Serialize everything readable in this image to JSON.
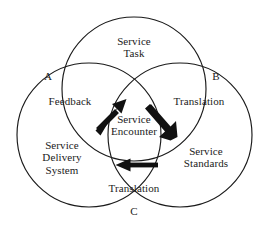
{
  "diagram": {
    "type": "venn-3-circle",
    "background_color": "#ffffff",
    "stroke_color": "#1a1a1a",
    "text_color": "#1b1b1b",
    "circles": [
      {
        "id": "top",
        "label": "Service\nTask",
        "cx": 134,
        "cy": 89,
        "r": 72
      },
      {
        "id": "left",
        "label": "Service\nDelivery\nSystem",
        "cx": 89,
        "cy": 135,
        "r": 72
      },
      {
        "id": "right",
        "label": "Service\nStandards",
        "cx": 180,
        "cy": 135,
        "r": 72
      }
    ],
    "regions": {
      "top_circle": "Service\nTask",
      "left_circle": "Service\nDelivery\nSystem",
      "right_circle": "Service\nStandards",
      "top_left_overlap": "Feedback",
      "top_right_overlap": "Translation",
      "bottom_overlap": "Translation",
      "center_overlap": "Service\nEncounter"
    },
    "intersection_points": [
      {
        "id": "a",
        "label": "A",
        "x": 61,
        "y": 78,
        "label_x": 48,
        "label_y": 76
      },
      {
        "id": "b",
        "label": "B",
        "x": 208,
        "y": 78,
        "label_x": 216,
        "label_y": 76
      },
      {
        "id": "c",
        "label": "C",
        "x": 134,
        "y": 200,
        "label_x": 134,
        "label_y": 211
      }
    ],
    "arrows": [
      {
        "id": "arrow-northeast",
        "direction": "up-right",
        "from_x": 97,
        "from_y": 129,
        "to_x": 123,
        "to_y": 102
      },
      {
        "id": "arrow-southeast",
        "direction": "down-right",
        "from_x": 148,
        "from_y": 103,
        "to_x": 176,
        "to_y": 136
      },
      {
        "id": "arrow-left",
        "direction": "left",
        "from_x": 157,
        "from_y": 165,
        "to_x": 116,
        "to_y": 165
      }
    ]
  }
}
